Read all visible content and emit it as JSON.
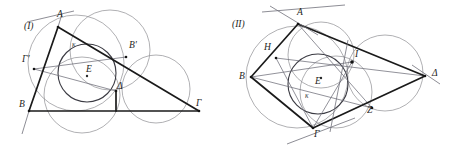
{
  "document": {
    "type": "geometry-figure-pair",
    "background_color": "#ffffff",
    "width": 452,
    "height": 147
  },
  "figures": [
    {
      "id": "figure-1",
      "caption": "(I)",
      "description": "Triangle with incircle, excircle-like tangent circles and tangency points",
      "labels": [
        {
          "name": "A",
          "text": "A",
          "x": 57,
          "y": 17
        },
        {
          "name": "B",
          "text": "B",
          "x": 19,
          "y": 107
        },
        {
          "name": "Gamma",
          "text": "Γ",
          "x": 196,
          "y": 106
        },
        {
          "name": "Gamma-prime",
          "text": "Γ'",
          "x": 22,
          "y": 62
        },
        {
          "name": "B-prime",
          "text": "B'",
          "x": 129,
          "y": 48
        },
        {
          "name": "Delta",
          "text": "Δ",
          "x": 117,
          "y": 89
        },
        {
          "name": "E",
          "text": "E",
          "x": 86,
          "y": 72
        },
        {
          "name": "kappa",
          "text": "κ",
          "x": 72,
          "y": 47
        }
      ]
    },
    {
      "id": "figure-2",
      "caption": "(II)",
      "description": "Quadrilateral BAΔΓ with inscribed circle, four tangent circles and tangency points",
      "labels": [
        {
          "name": "A",
          "text": "A",
          "x": 297,
          "y": 15
        },
        {
          "name": "B",
          "text": "B",
          "x": 239,
          "y": 79
        },
        {
          "name": "Gamma",
          "text": "Γ",
          "x": 314,
          "y": 137
        },
        {
          "name": "Delta",
          "text": "Δ",
          "x": 432,
          "y": 76
        },
        {
          "name": "H",
          "text": "H",
          "x": 264,
          "y": 50
        },
        {
          "name": "I",
          "text": "I",
          "x": 355,
          "y": 57
        },
        {
          "name": "Z",
          "text": "Z",
          "x": 367,
          "y": 113
        },
        {
          "name": "E",
          "text": "E",
          "x": 315,
          "y": 84
        },
        {
          "name": "kappa",
          "text": "κ",
          "x": 305,
          "y": 98
        }
      ]
    }
  ],
  "colors": {
    "heavy_stroke": "#1a1a1a",
    "thin_stroke": "#8e8e92",
    "incircle_stroke": "#3a3a42",
    "label_fill": "#1e1e22"
  }
}
